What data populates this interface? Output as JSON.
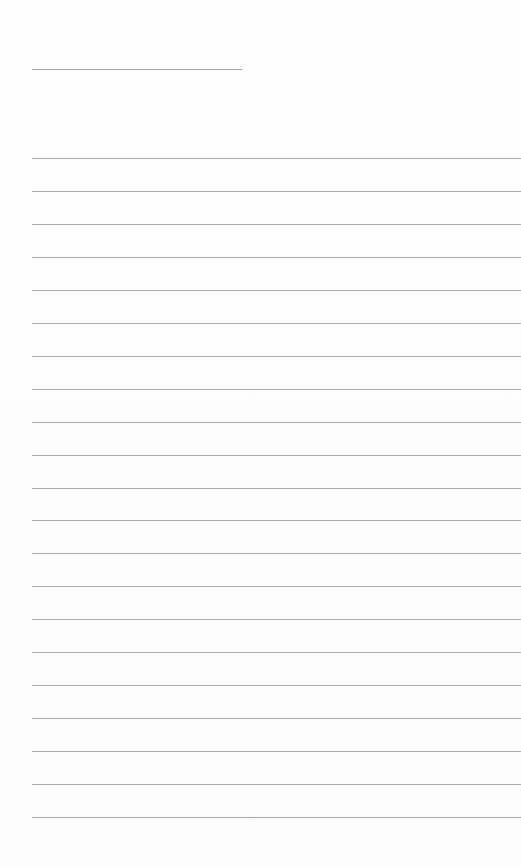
{
  "page": {
    "type": "lined-paper",
    "title_line": {
      "left": 32,
      "top": 69,
      "width": 210
    },
    "rules": {
      "count": 21,
      "first_top": 158,
      "spacing": 32.95,
      "left": 32
    },
    "colors": {
      "background": "#fdfdfd",
      "line": "#9a9a9a"
    }
  }
}
